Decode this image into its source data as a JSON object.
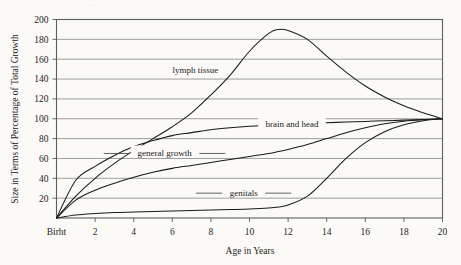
{
  "figure": {
    "background_color": "#fbfaf7",
    "ink_color": "#1a1a1a",
    "grid_color": "#8d8d8d",
    "top_edge_artifact": "......."
  },
  "chart_data": {
    "type": "line",
    "title": "",
    "xlabel": "Age in Years",
    "ylabel": "Size in Terms of Percentage of Total Growth",
    "xlim": [
      0,
      20
    ],
    "ylim": [
      0,
      200
    ],
    "grid": "horizontal",
    "legend": "inline-annotations",
    "x_tick_values": [
      0,
      2,
      4,
      6,
      8,
      10,
      12,
      14,
      16,
      18,
      20
    ],
    "x_tick_labels": [
      "Birht",
      "2",
      "4",
      "6",
      "8",
      "10",
      "12",
      "14",
      "16",
      "18",
      "20"
    ],
    "y_tick_values": [
      20,
      40,
      60,
      80,
      100,
      120,
      140,
      160,
      180,
      200
    ],
    "y_tick_labels": [
      "20",
      "40",
      "60",
      "80",
      "100",
      "120",
      "140",
      "160",
      "180",
      "200"
    ],
    "x": [
      0,
      1,
      2,
      3,
      4,
      5,
      6,
      7,
      8,
      9,
      10,
      11,
      11.5,
      12,
      13,
      14,
      15,
      16,
      17,
      18,
      19,
      20
    ],
    "series": [
      {
        "name": "lymph tissue",
        "label": "lymph tissue",
        "label_x": 7.2,
        "label_y": 146,
        "values": [
          0,
          22,
          40,
          55,
          68,
          80,
          92,
          106,
          124,
          144,
          168,
          186,
          190,
          189,
          180,
          163,
          147,
          133,
          122,
          113,
          106,
          100
        ]
      },
      {
        "name": "brain and head",
        "label": "brain and head",
        "label_x": 12.2,
        "label_y": 92,
        "values": [
          0,
          38,
          52,
          63,
          72,
          78,
          83,
          86,
          89,
          91,
          92.5,
          93.5,
          94,
          94.5,
          95.3,
          96,
          96.7,
          97.3,
          98,
          98.6,
          99.3,
          100
        ]
      },
      {
        "name": "general growth",
        "label": "general growth",
        "label_x": 5.6,
        "label_y": 62,
        "values": [
          0,
          18,
          28,
          35,
          41,
          46,
          50,
          53,
          56,
          59,
          62,
          65,
          67,
          69,
          74,
          80,
          86,
          91,
          95,
          97.5,
          99,
          100
        ]
      },
      {
        "name": "genitals",
        "label": "genitals",
        "label_x": 9.7,
        "label_y": 22,
        "values": [
          0,
          3,
          4.5,
          5.5,
          6,
          6.5,
          7,
          7.5,
          8,
          8.5,
          9,
          10,
          11,
          13,
          22,
          40,
          60,
          76,
          87,
          94,
          98,
          100
        ]
      }
    ]
  }
}
